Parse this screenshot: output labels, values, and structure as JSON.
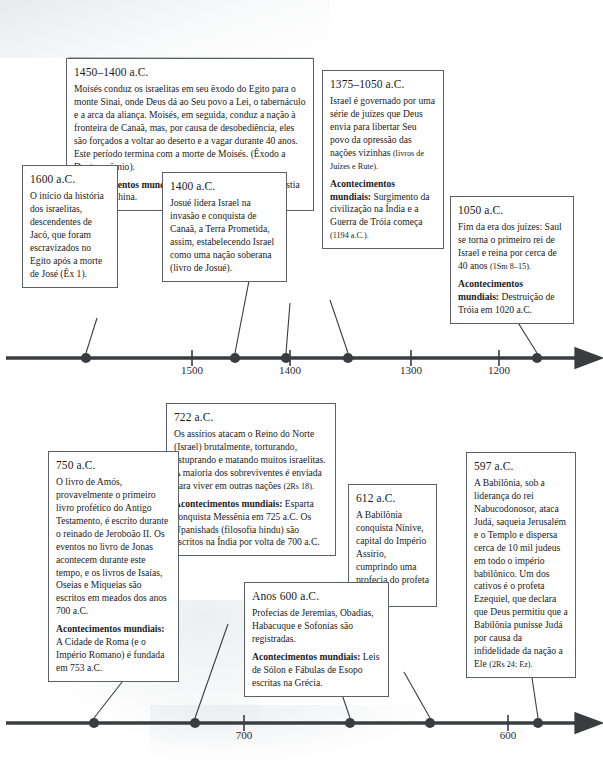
{
  "document": {
    "title": "Linha do Tempo Bíblica",
    "language": "pt-BR",
    "ink_color": "#1b1b1b",
    "line_color": "#3a3c40",
    "box_border_color": "#5d6066"
  },
  "timelines": [
    {
      "id": "upper-timeline",
      "axis_ticks": [
        "1500",
        "1400",
        "1300",
        "1200"
      ],
      "events": [
        {
          "id": "e1600",
          "header": "1600 a.C.",
          "body": "O início da história dos israelitas, descendentes de Jacó, que foram escravizados no Egito após a morte de José (Êx 1)."
        },
        {
          "id": "e1450",
          "header": "1450–1400 a.C.",
          "body": "Moisés conduz os israelitas em seu êxodo do Egito para o monte Sinai, onde Deus dá ao Seu povo a Lei, o tabernáculo e a arca da aliança. Moisés, em seguida, conduz a nação à fronteira de Canaã, mas, por causa de desobediência, eles são forçados a voltar ao deserto e a vagar durante 40 anos. Este período termina com a morte de Moisés. (Êxodo a Deuteronômio).",
          "world_label": "Acontecimentos mundiais:",
          "world_body": " O estabelecimento da dinastia Shang na China."
        },
        {
          "id": "e1400",
          "header": "1400 a.C.",
          "body": "Josué lidera Israel na invasão e conquista de Canaã, a Terra Prometida, assim, estabelecendo Israel como uma nação soberana (livro de Josué)."
        },
        {
          "id": "e1375",
          "header": "1375–1050 a.C.",
          "body": "Israel é governado por uma série de juízes que Deus envia para libertar Seu povo da opressão das nações vizinhas ",
          "body_small": "(livros de Juízes e Rute).",
          "world_label": "Acontecimentos mundiais:",
          "world_body": " Surgimento da civilização na Índia e a Guerra de Tróia começa ",
          "world_small": "(1194 a.C.)."
        },
        {
          "id": "e1050",
          "header": "1050 a.C.",
          "body": "Fim da era dos juízes: Saul se torna o primeiro rei de Israel e reina por cerca de 40 anos ",
          "body_small": "(1Sm 8–15).",
          "world_label": "Acontecimentos mundiais:",
          "world_body": " Destruição de Tróia em 1020 a.C."
        }
      ]
    },
    {
      "id": "lower-timeline",
      "axis_ticks": [
        "700",
        "600"
      ],
      "events": [
        {
          "id": "e750",
          "header": "750 a.C.",
          "body": "O livro de Amós, provavelmente o primeiro livro profético do Antigo Testamento, é escrito durante o reinado de Jeroboão II. Os eventos no livro de Jonas acontecem durante este tempo, e os livros de Isaías, Oseias e Miqueias são escritos em meados dos anos 700 a.C.",
          "world_label": "Acontecimentos mundiais:",
          "world_body": " A Cidade de Roma (e o Império Romano) é fundada em 753 a.C."
        },
        {
          "id": "e722",
          "header": "722 a.C.",
          "body": "Os assírios atacam o Reino do Norte (Israel) brutalmente, torturando, estuprando e matando muitos israelitas. A maioria dos sobreviventes é enviada para viver em outras nações ",
          "body_small": "(2Rs 18).",
          "world_label": "Acontecimentos mundiais:",
          "world_body": " Esparta conquista Messênia em 725 a.C. Os Upanishads (filosofia hindu) são escritos na Índia por volta de 700 a.C."
        },
        {
          "id": "e600s",
          "header": "Anos 600 a.C.",
          "body": "Profecias de Jeremias, Obadias, Habacuque e Sofonias são registradas.",
          "world_label": "Acontecimentos mundiais:",
          "world_body": " Leis de Sólon e Fábulas de Esopo escritas na Grécia."
        },
        {
          "id": "e612",
          "header": "612 a.C.",
          "body": "A Babilônia conquista Nínive, capital do Império Assírio, cumprindo uma profecia do profeta Naum."
        },
        {
          "id": "e597",
          "header": "597 a.C.",
          "body": "A Babilônia, sob a liderança do rei Nabucodonosor, ataca Judá, saqueia Jerusalém e o Templo e dispersa cerca de 10 mil judeus em todo o império babilônico. Um dos cativos é o profeta Ezequiel, que declara que Deus permitiu que a Babilônia punisse Judá por causa da infidelidade da nação a Ele ",
          "body_small": "(2Rs 24; Ez)."
        }
      ]
    }
  ],
  "axis_labels": {
    "u1500": "1500",
    "u1400": "1400",
    "u1300": "1300",
    "u1200": "1200",
    "l700": "700",
    "l600": "600"
  }
}
